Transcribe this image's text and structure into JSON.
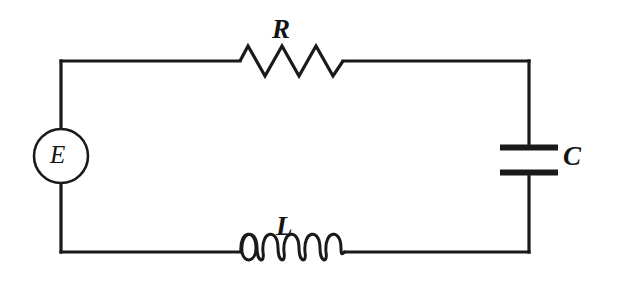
{
  "figure": {
    "type": "schematic",
    "name": "series-rlc-circuit",
    "width": 617,
    "height": 290,
    "background_color": "#ffffff",
    "line_color": "#1a1a1a"
  },
  "components": {
    "source": {
      "label": "E",
      "kind": "voltage-source",
      "shape": "circle",
      "center_x": 61,
      "center_y": 156,
      "radius": 27
    },
    "resistor": {
      "label": "R",
      "kind": "resistor",
      "shape": "zigzag",
      "x_start": 240,
      "x_end": 343,
      "y": 61,
      "peaks": 6
    },
    "capacitor": {
      "label": "C",
      "kind": "capacitor",
      "shape": "parallel-plates",
      "plate_x_start": 500,
      "plate_x_end": 558,
      "plate_top_y": 148,
      "plate_bottom_y": 172
    },
    "inductor": {
      "label": "L",
      "kind": "inductor",
      "shape": "coil",
      "x_start": 240,
      "x_end": 345,
      "y": 252,
      "loops": 5
    }
  },
  "wires": {
    "left_x": 61,
    "right_x": 529,
    "top_y": 61,
    "bottom_y": 252
  }
}
